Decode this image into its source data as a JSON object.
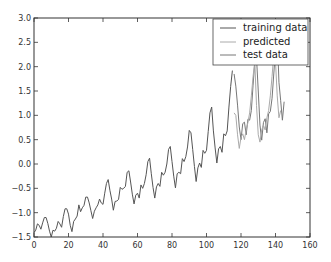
{
  "chart_data": {
    "type": "line",
    "title": "",
    "xlabel": "",
    "ylabel": "",
    "xlim": [
      0,
      160
    ],
    "ylim": [
      -1.5,
      3.0
    ],
    "grid": false,
    "legend_position": "upper right",
    "xticks": [
      0,
      20,
      40,
      60,
      80,
      100,
      120,
      140,
      160
    ],
    "yticks": [
      -1.5,
      -1.0,
      -0.5,
      0.0,
      0.5,
      1.0,
      1.5,
      2.0,
      2.5,
      3.0
    ],
    "xtick_labels": [
      "0",
      "20",
      "40",
      "60",
      "80",
      "100",
      "120",
      "140",
      "160"
    ],
    "ytick_labels": [
      "−1.5",
      "−1.0",
      "−0.5",
      "0.0",
      "0.5",
      "1.0",
      "1.5",
      "2.0",
      "2.5",
      "3.0"
    ],
    "series": [
      {
        "name": "training data",
        "color": "#555555",
        "x_start": 0,
        "values": [
          -1.41,
          -1.36,
          -1.23,
          -1.26,
          -1.34,
          -1.21,
          -1.1,
          -1.1,
          -1.22,
          -1.38,
          -1.5,
          -1.36,
          -1.38,
          -1.32,
          -1.18,
          -1.23,
          -1.3,
          -1.08,
          -0.92,
          -0.92,
          -1.03,
          -1.26,
          -1.39,
          -1.18,
          -1.13,
          -1.07,
          -0.84,
          -0.98,
          -0.9,
          -0.85,
          -0.68,
          -0.68,
          -0.8,
          -0.96,
          -1.12,
          -0.97,
          -0.9,
          -0.84,
          -0.72,
          -0.8,
          -0.83,
          -0.6,
          -0.4,
          -0.32,
          -0.54,
          -0.72,
          -0.95,
          -0.77,
          -0.76,
          -0.73,
          -0.48,
          -0.52,
          -0.5,
          -0.46,
          -0.17,
          -0.14,
          -0.37,
          -0.62,
          -0.82,
          -0.64,
          -0.6,
          -0.7,
          -0.43,
          -0.5,
          -0.4,
          -0.22,
          0.05,
          0.12,
          -0.2,
          -0.48,
          -0.7,
          -0.47,
          -0.4,
          -0.46,
          -0.17,
          -0.23,
          -0.17,
          0.0,
          0.3,
          0.36,
          0.05,
          -0.25,
          -0.49,
          -0.2,
          -0.17,
          -0.2,
          0.11,
          0.05,
          0.15,
          0.35,
          0.69,
          0.64,
          0.3,
          -0.05,
          -0.36,
          -0.08,
          0.02,
          -0.07,
          0.28,
          0.22,
          0.28,
          0.67,
          1.05,
          1.17,
          0.68,
          0.33,
          0.02,
          0.31,
          0.36,
          0.24,
          0.62,
          0.58,
          0.68,
          1.17,
          1.59,
          1.92
        ]
      },
      {
        "name": "predicted",
        "color": "#aaaaaa",
        "x_start": 116,
        "values": [
          1.05,
          1.0,
          0.6,
          0.32,
          0.55,
          0.62,
          0.5,
          0.7,
          0.85,
          1.05,
          1.4,
          1.8,
          2.1,
          1.2,
          0.6,
          0.45,
          0.7,
          0.8,
          0.7,
          0.95,
          1.1,
          1.4,
          1.8,
          2.25,
          2.1,
          1.4,
          0.95,
          1.1
        ]
      },
      {
        "name": "test data",
        "color": "#777777",
        "x_start": 116,
        "values": [
          1.85,
          1.6,
          1.21,
          0.76,
          0.5,
          0.83,
          0.86,
          0.6,
          0.92,
          0.9,
          1.1,
          1.62,
          2.1,
          2.18,
          1.5,
          0.8,
          0.49,
          0.85,
          0.93,
          0.64,
          1.03,
          1.08,
          1.35,
          1.85,
          2.35,
          2.68,
          1.68,
          1.3,
          0.9,
          1.28
        ]
      }
    ]
  },
  "legend": {
    "items": [
      {
        "label": "training data",
        "color": "#555555"
      },
      {
        "label": "predicted",
        "color": "#aaaaaa"
      },
      {
        "label": "test data",
        "color": "#777777"
      }
    ]
  }
}
